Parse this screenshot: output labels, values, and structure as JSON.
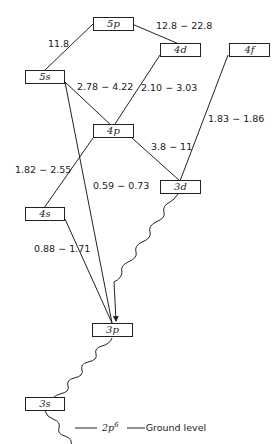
{
  "levels": {
    "5p": "5p",
    "4d": "4d",
    "4f": "4f",
    "5s": "5s",
    "4p": "4p",
    "3d": "3d",
    "4s": "4s",
    "3p": "3p",
    "3s": "3s"
  },
  "transitions": [
    {
      "from": "5s",
      "to": "5p",
      "label": "11.8"
    },
    {
      "from": "5p",
      "to": "4d",
      "label": "12.8 − 22.8"
    },
    {
      "from": "5s",
      "to": "4p",
      "label": "2.78 − 4.22"
    },
    {
      "from": "4p",
      "to": "4d",
      "label": "2.10 − 3.03"
    },
    {
      "from": "3d",
      "to": "4f",
      "label": "1.83 − 1.86"
    },
    {
      "from": "4p",
      "to": "3d",
      "label": "3.8 − 11"
    },
    {
      "from": "4s",
      "to": "4p",
      "label": "1.82 − 2.55"
    },
    {
      "from": "5s",
      "to": "3p",
      "label": "0.59 − 0.73"
    },
    {
      "from": "4s",
      "to": "3p",
      "label": "0.88 − 1.71"
    }
  ],
  "decays": [
    {
      "from": "3d",
      "to": "3p"
    },
    {
      "from": "3p",
      "to": "3s"
    },
    {
      "from": "3s",
      "to": "2p6"
    }
  ],
  "ground": {
    "config_base": "2p",
    "config_exp": "6",
    "label": "Ground level"
  },
  "colors": {
    "line": "#222222",
    "background": "#ffffff"
  }
}
